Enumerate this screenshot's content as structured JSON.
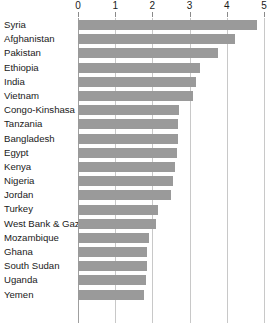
{
  "chart_data": {
    "type": "bar",
    "orientation": "horizontal",
    "title": "",
    "subtitle": "",
    "xlabel": "",
    "ylabel": "",
    "xlim": [
      0,
      5
    ],
    "grid": true,
    "legend": null,
    "legend_position": "none",
    "bar_color": "#9a9a9a",
    "gridline_color": "#c8c8c8",
    "axis_color": "#9f9f9f",
    "xticks": [
      0,
      1,
      2,
      3,
      4,
      5
    ],
    "xtick_labels": [
      "0",
      "1",
      "2",
      "3",
      "4",
      "5"
    ],
    "categories": [
      "Syria",
      "Afghanistan",
      "Pakistan",
      "Ethiopia",
      "India",
      "Vietnam",
      "Congo-Kinshasa",
      "Tanzania",
      "Bangladesh",
      "Egypt",
      "Kenya",
      "Nigeria",
      "Jordan",
      "Turkey",
      "West Bank & Gaza",
      "Mozambique",
      "Ghana",
      "South Sudan",
      "Uganda",
      "Yemen"
    ],
    "values": [
      4.81,
      4.22,
      3.76,
      3.28,
      3.17,
      3.09,
      2.72,
      2.7,
      2.68,
      2.66,
      2.6,
      2.55,
      2.5,
      2.15,
      2.1,
      1.9,
      1.86,
      1.85,
      1.82,
      1.78
    ]
  }
}
